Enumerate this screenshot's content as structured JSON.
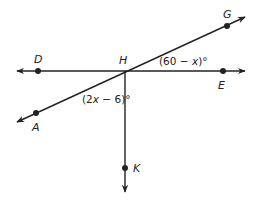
{
  "diagram": {
    "type": "geometry-lines-angles",
    "colors": {
      "stroke": "#222222",
      "background": "#ffffff"
    },
    "points": {
      "D": {
        "label": "D",
        "x": 38,
        "y": 71
      },
      "H": {
        "label": "H",
        "x": 125,
        "y": 71
      },
      "E": {
        "label": "E",
        "x": 223,
        "y": 71
      },
      "G": {
        "label": "G",
        "x": 227,
        "y": 26
      },
      "A": {
        "label": "A",
        "x": 36,
        "y": 113
      },
      "K": {
        "label": "K",
        "x": 125,
        "y": 168
      }
    },
    "lines": [
      {
        "name": "line-DE",
        "through": [
          "D",
          "H",
          "E"
        ],
        "arrows": "both"
      },
      {
        "name": "line-AG",
        "through": [
          "A",
          "H",
          "G"
        ],
        "arrows": "both"
      },
      {
        "name": "ray-HK",
        "through": [
          "H",
          "K"
        ],
        "arrows": "end"
      }
    ],
    "angles": [
      {
        "name": "angle-GHE",
        "vertex": "H",
        "between": [
          "G",
          "E"
        ],
        "expression_prefix": "(60 − ",
        "variable": "x",
        "expression_suffix": ")°"
      },
      {
        "name": "angle-AHK",
        "vertex": "H",
        "between": [
          "A",
          "K"
        ],
        "expression_prefix": "(2",
        "variable": "x",
        "expression_suffix": " − 6)°"
      }
    ]
  }
}
